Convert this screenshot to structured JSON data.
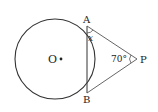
{
  "diagram": {
    "type": "circle-tangent-geometry",
    "labels": {
      "center": "O",
      "point_a": "A",
      "point_b": "B",
      "point_p": "P",
      "angle_x": "x",
      "angle_p": "70°"
    },
    "colors": {
      "stroke": "#333333",
      "text": "#222222",
      "background": "#ffffff"
    }
  }
}
